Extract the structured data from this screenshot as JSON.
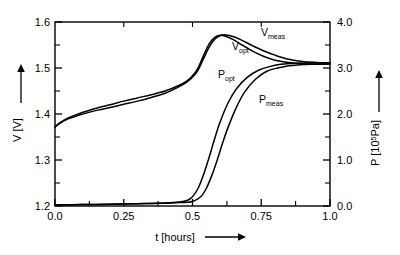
{
  "chart_data": {
    "type": "line",
    "title": "",
    "xlabel": "t [hours]",
    "ylabel": "V [V]",
    "ylabel_right": "P [10⁵Pa]",
    "xlim": [
      0.0,
      1.0
    ],
    "ylim": [
      1.2,
      1.6
    ],
    "ylim_right": [
      0.0,
      4.0
    ],
    "grid": false,
    "legend_position": "inline-annotations",
    "xticks": [
      "0.0",
      "0.25",
      "0.5",
      "0.75",
      "1.0"
    ],
    "xtick_values": [
      0.0,
      0.25,
      0.5,
      0.75,
      1.0
    ],
    "x_minor_ticks": [
      0.125,
      0.375,
      0.625,
      0.875
    ],
    "yticks_left": [
      "1.2",
      "1.3",
      "1.4",
      "1.5",
      "1.6"
    ],
    "ytick_values_left": [
      1.2,
      1.3,
      1.4,
      1.5,
      1.6
    ],
    "y_minor_ticks_left": [
      1.25,
      1.35,
      1.45,
      1.55
    ],
    "yticks_right": [
      "0.0",
      "1.0",
      "2.0",
      "3.0",
      "4.0"
    ],
    "ytick_values_right": [
      0.0,
      1.0,
      2.0,
      3.0,
      4.0
    ],
    "y_minor_ticks_right": [
      0.5,
      1.5,
      2.5,
      3.5
    ],
    "series": [
      {
        "name": "V_meas",
        "label_main": "V",
        "label_sub": "meas",
        "axis": "left",
        "units": "V",
        "x": [
          0.0,
          0.02,
          0.05,
          0.08,
          0.12,
          0.16,
          0.2,
          0.25,
          0.3,
          0.35,
          0.4,
          0.45,
          0.48,
          0.5,
          0.52,
          0.54,
          0.56,
          0.58,
          0.6,
          0.62,
          0.65,
          0.68,
          0.72,
          0.76,
          0.8,
          0.85,
          0.9,
          0.95,
          1.0
        ],
        "values": [
          1.372,
          1.381,
          1.39,
          1.396,
          1.403,
          1.409,
          1.414,
          1.421,
          1.428,
          1.436,
          1.445,
          1.459,
          1.47,
          1.48,
          1.495,
          1.52,
          1.545,
          1.562,
          1.57,
          1.572,
          1.568,
          1.56,
          1.548,
          1.537,
          1.528,
          1.519,
          1.514,
          1.512,
          1.511
        ]
      },
      {
        "name": "V_opt",
        "label_main": "V",
        "label_sub": "opt",
        "axis": "left",
        "units": "V",
        "x": [
          0.0,
          0.02,
          0.05,
          0.08,
          0.12,
          0.16,
          0.2,
          0.25,
          0.3,
          0.35,
          0.4,
          0.45,
          0.48,
          0.5,
          0.52,
          0.54,
          0.56,
          0.58,
          0.6,
          0.62,
          0.65,
          0.68,
          0.72,
          0.76,
          0.8,
          0.85,
          0.9,
          0.95,
          1.0
        ],
        "values": [
          1.372,
          1.382,
          1.392,
          1.399,
          1.407,
          1.414,
          1.42,
          1.428,
          1.435,
          1.442,
          1.45,
          1.462,
          1.472,
          1.483,
          1.5,
          1.527,
          1.552,
          1.566,
          1.571,
          1.569,
          1.561,
          1.55,
          1.536,
          1.525,
          1.517,
          1.512,
          1.509,
          1.508,
          1.508
        ]
      },
      {
        "name": "P_opt",
        "label_main": "P",
        "label_sub": "opt",
        "axis": "right",
        "units": "10^5 Pa",
        "x": [
          0.0,
          0.1,
          0.2,
          0.3,
          0.38,
          0.44,
          0.48,
          0.5,
          0.52,
          0.54,
          0.56,
          0.58,
          0.6,
          0.63,
          0.66,
          0.7,
          0.74,
          0.78,
          0.82,
          0.86,
          0.9,
          0.95,
          1.0
        ],
        "values": [
          0.02,
          0.03,
          0.04,
          0.05,
          0.06,
          0.08,
          0.12,
          0.2,
          0.38,
          0.68,
          1.05,
          1.45,
          1.82,
          2.25,
          2.55,
          2.8,
          2.95,
          3.03,
          3.08,
          3.1,
          3.11,
          3.11,
          3.11
        ]
      },
      {
        "name": "P_meas",
        "label_main": "P",
        "label_sub": "meas",
        "axis": "right",
        "units": "10^5 Pa",
        "x": [
          0.0,
          0.1,
          0.2,
          0.3,
          0.38,
          0.44,
          0.5,
          0.53,
          0.55,
          0.57,
          0.59,
          0.61,
          0.63,
          0.66,
          0.69,
          0.73,
          0.77,
          0.81,
          0.85,
          0.89,
          0.93,
          0.97,
          1.0
        ],
        "values": [
          0.02,
          0.03,
          0.04,
          0.05,
          0.06,
          0.07,
          0.1,
          0.2,
          0.38,
          0.66,
          1.0,
          1.38,
          1.72,
          2.15,
          2.48,
          2.76,
          2.93,
          3.0,
          3.05,
          3.07,
          3.08,
          3.08,
          3.08
        ]
      }
    ]
  },
  "axes": {
    "x_axis_label": "t [hours]",
    "y_left_label": "V [V]",
    "y_right_label_main": "P [10",
    "y_right_label_sup": "5",
    "y_right_label_tail": "Pa]"
  },
  "annotations": {
    "v_meas": {
      "main": "V",
      "sub": "meas"
    },
    "v_opt": {
      "main": "V",
      "sub": "opt"
    },
    "p_opt": {
      "main": "P",
      "sub": "opt"
    },
    "p_meas": {
      "main": "P",
      "sub": "meas"
    }
  },
  "colors": {
    "axis": "#000000",
    "curve": "#000000",
    "background": "#ffffff"
  }
}
